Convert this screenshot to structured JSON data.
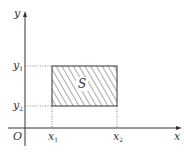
{
  "figure": {
    "axes": {
      "x_label": "x",
      "y_label": "y",
      "origin_label": "O"
    },
    "ticks": {
      "x": [
        {
          "base": "x",
          "sub": "1"
        },
        {
          "base": "x",
          "sub": "2"
        }
      ],
      "y": [
        {
          "base": "y",
          "sub": "1"
        },
        {
          "base": "y",
          "sub": "2"
        }
      ]
    },
    "region": {
      "label": "S",
      "fill": "hatched"
    },
    "colors": {
      "axis": "#333333",
      "hatch": "#555555",
      "guide": "#666666"
    }
  }
}
